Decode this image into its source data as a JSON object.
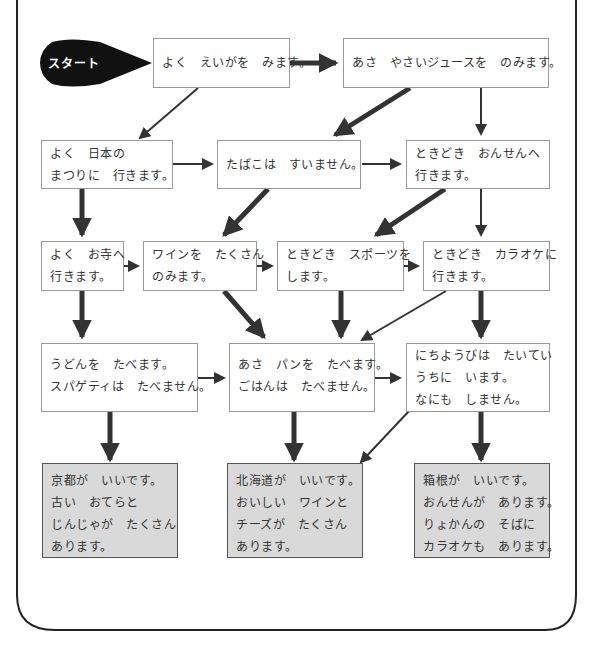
{
  "start": {
    "label": "スタート"
  },
  "nodes": [
    {
      "id": "movies",
      "lines": [
        "よく　えいがを　みます。"
      ]
    },
    {
      "id": "juice",
      "lines": [
        "あさ　やさいジュースを　のみます。"
      ]
    },
    {
      "id": "festival",
      "lines": [
        "よく　日本の",
        "まつりに　行きます。"
      ]
    },
    {
      "id": "smoke",
      "lines": [
        "たばこは　すいません。"
      ]
    },
    {
      "id": "onsen",
      "lines": [
        "ときどき　おんせんへ",
        "行きます。"
      ]
    },
    {
      "id": "temple",
      "lines": [
        "よく　お寺へ",
        "行きます。"
      ]
    },
    {
      "id": "wine",
      "lines": [
        "ワインを　たくさん",
        "のみます。"
      ]
    },
    {
      "id": "sports",
      "lines": [
        "ときどき　スポーツを",
        "します。"
      ]
    },
    {
      "id": "karaoke",
      "lines": [
        "ときどき　カラオケに",
        "行きます。"
      ]
    },
    {
      "id": "udon",
      "lines": [
        "うどんを　たべます。",
        "スパゲティは　たべません。"
      ]
    },
    {
      "id": "bread",
      "lines": [
        "あさ　パンを　たべます。",
        "ごはんは　たべません。"
      ]
    },
    {
      "id": "sunday",
      "lines": [
        "にちようびは　たいてい",
        "うちに　います。",
        "なにも　しません。"
      ]
    }
  ],
  "results": [
    {
      "id": "kyoto",
      "lines": [
        "京都が　いいです。",
        "古い　おてらと",
        "じんじゃが　たくさん",
        "あります。"
      ]
    },
    {
      "id": "hokkaido",
      "lines": [
        "北海道が　いいです。",
        "おいしい　ワインと",
        "チーズが　たくさん",
        "あります。"
      ]
    },
    {
      "id": "hakone",
      "lines": [
        "箱根が　いいです。",
        "おんせんが　あります。",
        "りょかんの　そばに",
        "カラオケも　あります。"
      ]
    }
  ],
  "colors": {
    "line": "#333333",
    "result_fill": "#d9d9d9",
    "start_fill": "#111111"
  }
}
